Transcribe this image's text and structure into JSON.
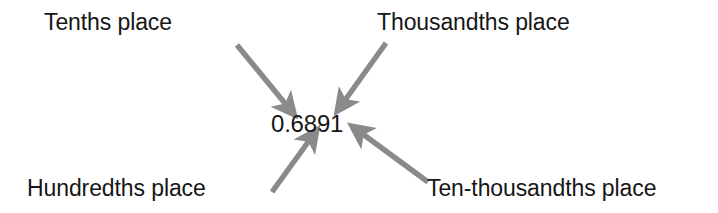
{
  "diagram": {
    "background_color": "#ffffff",
    "text_color": "#161616",
    "arrow_color": "#8a8a8a",
    "value": "0.6891",
    "labels": {
      "tenths": "Tenths place",
      "thousandths": "Thousandths place",
      "hundredths": "Hundredths place",
      "ten_thousandths": "Ten-thousandths place"
    },
    "arrows": [
      {
        "name": "arrow-tenths",
        "from_label": "Tenths place",
        "points_to_digit": "6",
        "tail": [
          237,
          45
        ],
        "head": [
          291,
          111
        ],
        "direction": "down-right"
      },
      {
        "name": "arrow-thousandths",
        "from_label": "Thousandths place",
        "points_to_digit": "9",
        "tail": [
          386,
          43
        ],
        "head": [
          340,
          107
        ],
        "direction": "down-left"
      },
      {
        "name": "arrow-hundredths",
        "from_label": "Hundredths place",
        "points_to_digit": "8",
        "tail": [
          272,
          192
        ],
        "head": [
          314,
          134
        ],
        "direction": "up-right"
      },
      {
        "name": "arrow-ten-thousandths",
        "from_label": "Ten-thousandths place",
        "points_to_digit": "1",
        "tail": [
          428,
          182
        ],
        "head": [
          356,
          128
        ],
        "direction": "up-left"
      }
    ]
  }
}
